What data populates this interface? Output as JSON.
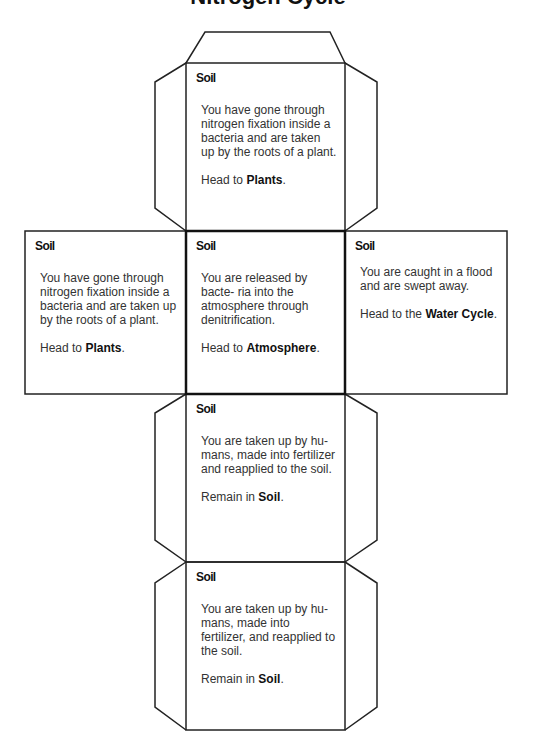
{
  "title": "Nitrogen Cycle",
  "faces": {
    "top": {
      "heading": "Soil",
      "text": "You have gone through nitrogen fixation inside a bacteria and are taken up by the roots of a plant.",
      "action_prefix": "Head to ",
      "action_target": "Plants",
      "action_suffix": "."
    },
    "left": {
      "heading": "Soil",
      "text": "You have gone through nitrogen fixation inside a bacteria and are taken up by the roots of a plant.",
      "action_prefix": "Head to ",
      "action_target": "Plants",
      "action_suffix": "."
    },
    "center": {
      "heading": "Soil",
      "text": "You are released by bacte- ria into the atmosphere through denitrification.",
      "action_prefix": "Head to ",
      "action_target": "Atmosphere",
      "action_suffix": "."
    },
    "right": {
      "heading": "Soil",
      "text": "You are caught in a flood and are swept away.",
      "action_prefix": "Head to the ",
      "action_target": "Water Cycle",
      "action_suffix": "."
    },
    "lower": {
      "heading": "Soil",
      "text": "You are taken up by hu- mans, made into fertilizer and reapplied to the soil.",
      "action_prefix": "Remain in ",
      "action_target": "Soil",
      "action_suffix": "."
    },
    "bottom": {
      "heading": "Soil",
      "text": "You are taken up by hu- mans, made into fertilizer, and reapplied to the soil.",
      "action_prefix": "Remain in ",
      "action_target": "Soil",
      "action_suffix": "."
    }
  }
}
